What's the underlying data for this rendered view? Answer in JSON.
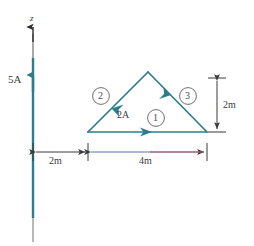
{
  "figure": {
    "colors": {
      "wire": "#2d7d8c",
      "loop": "#2d7d8c",
      "dimension": "#3b3b3b",
      "text": "#3b3b3b",
      "tint_blue": "#5a6fb0",
      "tint_red": "#b05a5a"
    },
    "axis": {
      "name": "z-axis",
      "label": "z"
    },
    "wire": {
      "name": "long-straight-wire",
      "current_label": "5A"
    },
    "loop": {
      "name": "triangular-loop",
      "current_label": "2A",
      "segments": [
        {
          "id": "1",
          "label": "1",
          "name": "segment-1-bottom"
        },
        {
          "id": "2",
          "label": "2",
          "name": "segment-2-left"
        },
        {
          "id": "3",
          "label": "3",
          "name": "segment-3-right"
        }
      ]
    },
    "dimensions": [
      {
        "name": "distance-wire-to-loop",
        "label": "2m",
        "orientation": "horizontal"
      },
      {
        "name": "loop-base-width",
        "label": "4m",
        "orientation": "horizontal"
      },
      {
        "name": "loop-height",
        "label": "2m",
        "orientation": "vertical"
      }
    ]
  }
}
